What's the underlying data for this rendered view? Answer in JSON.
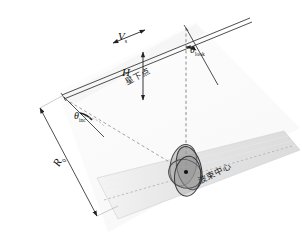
{
  "figure": {
    "background_color": "#ffffff",
    "line_color": "#3a3a3a",
    "dash_color": "#8a8a8a",
    "swath_fill": "#e2e2e2",
    "ellipse_fill": "#9a9a9a",
    "width": 302,
    "height": 245
  },
  "labels": {
    "velocity": "V",
    "velocity_sub": "s",
    "altitude": "H",
    "nadir_point": "星下点",
    "look_angle": "θ",
    "look_angle_sub": "look",
    "incidence_angle": "θ",
    "incidence_angle_sub": "inc",
    "slant_range": "R",
    "slant_range_sub": "0",
    "beam_center": "波束中心"
  },
  "elements": {
    "orbit_track": "satellite-flight-track",
    "nadir_line": "nadir-dashed-line",
    "slant_range_line": "slant-range-dashed-line",
    "swath": "ground-swath-band",
    "footprint": "beam-footprint-ellipses",
    "beam_center_dot": "beam-center-point"
  }
}
